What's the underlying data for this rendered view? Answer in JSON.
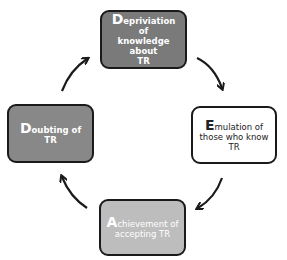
{
  "diagram": {
    "type": "cycle",
    "nodes": [
      {
        "id": "top",
        "initial": "D",
        "rest": "epriviation of",
        "line2": "knowledge about",
        "line3": "TR",
        "fill": "#7a7a7a",
        "text_color": "#ffffff"
      },
      {
        "id": "right",
        "initial": "E",
        "rest": "mulation of",
        "line2": "those who know",
        "line3": "TR",
        "fill": "#ffffff",
        "text_color": "#222222"
      },
      {
        "id": "bottom",
        "initial": "A",
        "rest": "chievement of",
        "line2": "accepting TR",
        "line3": "",
        "fill": "#bdbdbd",
        "text_color": "#ffffff"
      },
      {
        "id": "left",
        "initial": "D",
        "rest": "oubting of TR",
        "line2": "",
        "line3": "",
        "fill": "#888888",
        "text_color": "#ffffff"
      }
    ],
    "edges": [
      {
        "from": "top",
        "to": "right"
      },
      {
        "from": "right",
        "to": "bottom"
      },
      {
        "from": "bottom",
        "to": "left"
      },
      {
        "from": "left",
        "to": "top"
      }
    ]
  }
}
